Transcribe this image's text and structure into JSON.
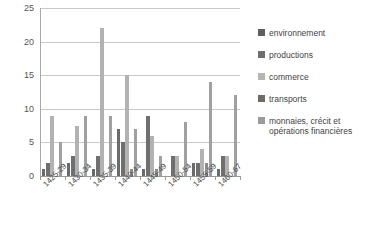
{
  "chart_data": {
    "type": "bar",
    "title": "",
    "subtitle": "",
    "xlabel": "",
    "ylabel": "",
    "ylim": [
      0,
      25
    ],
    "yticks": [
      0,
      5,
      10,
      15,
      20,
      25
    ],
    "grid": true,
    "legend_position": "right",
    "categories": [
      "1425-29",
      "1430-34",
      "1435-39",
      "1440-44",
      "1445-49",
      "1450-54",
      "1455-59",
      "1460-67"
    ],
    "series": [
      {
        "name": "environnement",
        "color": "#5f5f5f",
        "values": [
          1,
          0,
          1,
          5,
          0.5,
          0,
          0,
          1
        ]
      },
      {
        "name": "productions",
        "color": "#6e6e6e",
        "values": [
          2,
          2,
          1,
          4,
          1,
          0,
          2,
          1.5
        ]
      },
      {
        "name": "commerce",
        "color": "#b4b4b4",
        "values": [
          9,
          7.5,
          22,
          15,
          8,
          8,
          14,
          12
        ]
      },
      {
        "name": "transports",
        "color": "#8c8c8c",
        "values": [
          0,
          6,
          0,
          0,
          0,
          0,
          0,
          0
        ]
      },
      {
        "name": "monnaies, crécit et opérations financières",
        "color": "#9b9b9b",
        "values": [
          5,
          9,
          9,
          6,
          3,
          3,
          3,
          3
        ]
      }
    ],
    "bar_groups": [
      {
        "category": "1425-29",
        "bars": [
          {
            "series": "environnement",
            "value": 1,
            "color": "#6a6a6a"
          },
          {
            "series": "productions",
            "value": 2,
            "color": "#6f6f6f"
          },
          {
            "series": "commerce",
            "value": 9,
            "color": "#b2b2b2"
          },
          {
            "series": "transports",
            "value": 0,
            "color": "#8c8c8c"
          },
          {
            "series": "monnaies",
            "value": 5,
            "color": "#a0a0a0"
          }
        ]
      },
      {
        "category": "1430-34",
        "bars": [
          {
            "series": "environnement",
            "value": 2,
            "color": "#6a6a6a"
          },
          {
            "series": "productions",
            "value": 3,
            "color": "#6f6f6f"
          },
          {
            "series": "commerce",
            "value": 7.5,
            "color": "#b2b2b2"
          },
          {
            "series": "transports",
            "value": 0,
            "color": "#8c8c8c"
          },
          {
            "series": "monnaies",
            "value": 9,
            "color": "#a0a0a0"
          }
        ]
      },
      {
        "category": "1435-39",
        "bars": [
          {
            "series": "environnement",
            "value": 1,
            "color": "#6a6a6a"
          },
          {
            "series": "productions",
            "value": 3,
            "color": "#6f6f6f"
          },
          {
            "series": "commerce",
            "value": 22,
            "color": "#b2b2b2"
          },
          {
            "series": "transports",
            "value": 0,
            "color": "#8c8c8c"
          },
          {
            "series": "monnaies",
            "value": 9,
            "color": "#a0a0a0"
          }
        ]
      },
      {
        "category": "1440-44",
        "bars": [
          {
            "series": "environnement",
            "value": 7,
            "color": "#6a6a6a"
          },
          {
            "series": "productions",
            "value": 5,
            "color": "#6f6f6f"
          },
          {
            "series": "commerce",
            "value": 15,
            "color": "#b2b2b2"
          },
          {
            "series": "transports",
            "value": 1,
            "color": "#8c8c8c"
          },
          {
            "series": "monnaies",
            "value": 7,
            "color": "#a0a0a0"
          }
        ]
      },
      {
        "category": "1445-49",
        "bars": [
          {
            "series": "environnement",
            "value": 1,
            "color": "#6a6a6a"
          },
          {
            "series": "productions",
            "value": 9,
            "color": "#6f6f6f"
          },
          {
            "series": "commerce",
            "value": 6,
            "color": "#b2b2b2"
          },
          {
            "series": "transports",
            "value": 1,
            "color": "#8c8c8c"
          },
          {
            "series": "monnaies",
            "value": 3,
            "color": "#a0a0a0"
          }
        ]
      },
      {
        "category": "1450-54",
        "bars": [
          {
            "series": "environnement",
            "value": 0,
            "color": "#6a6a6a"
          },
          {
            "series": "productions",
            "value": 3,
            "color": "#6f6f6f"
          },
          {
            "series": "commerce",
            "value": 3,
            "color": "#b2b2b2"
          },
          {
            "series": "transports",
            "value": 0,
            "color": "#8c8c8c"
          },
          {
            "series": "monnaies",
            "value": 8,
            "color": "#a0a0a0"
          }
        ]
      },
      {
        "category": "1455-59",
        "bars": [
          {
            "series": "environnement",
            "value": 2,
            "color": "#6a6a6a"
          },
          {
            "series": "productions",
            "value": 2,
            "color": "#6f6f6f"
          },
          {
            "series": "commerce",
            "value": 4,
            "color": "#b2b2b2"
          },
          {
            "series": "transports",
            "value": 2,
            "color": "#8c8c8c"
          },
          {
            "series": "monnaies",
            "value": 14,
            "color": "#a0a0a0"
          }
        ]
      },
      {
        "category": "1460-67",
        "bars": [
          {
            "series": "environnement",
            "value": 1,
            "color": "#6a6a6a"
          },
          {
            "series": "productions",
            "value": 3,
            "color": "#6f6f6f"
          },
          {
            "series": "commerce",
            "value": 3,
            "color": "#b2b2b2"
          },
          {
            "series": "transports",
            "value": 0,
            "color": "#8c8c8c"
          },
          {
            "series": "monnaies",
            "value": 12,
            "color": "#a0a0a0"
          }
        ]
      }
    ]
  },
  "axis": {
    "y_labels": [
      "25",
      "20",
      "15",
      "10",
      "5",
      "0"
    ],
    "x_labels": [
      "1425-29",
      "1430-34",
      "1435-39",
      "1440-44",
      "1445-49",
      "1450-54",
      "1455-59",
      "1460-67"
    ]
  },
  "legend": {
    "items": [
      {
        "label": "environnement",
        "color": "#5f5f5f"
      },
      {
        "label": "productions",
        "color": "#6e6e6e"
      },
      {
        "label": "commerce",
        "color": "#b4b4b4"
      },
      {
        "label": "transports",
        "color": "#6b6b6b"
      },
      {
        "label": "monnaies, crécit et\nopérations financières",
        "color": "#9b9b9b"
      }
    ]
  },
  "style": {
    "background": "#ffffff",
    "grid_color": "#c9c9c9",
    "axis_color": "#9a9a9a",
    "text_color": "#3f3f3f"
  }
}
